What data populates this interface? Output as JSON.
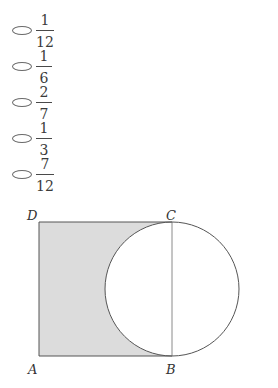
{
  "options": [
    {
      "id": "a",
      "numerator": "1",
      "denominator": "12"
    },
    {
      "id": "b",
      "numerator": "1",
      "denominator": "6"
    },
    {
      "id": "c",
      "numerator": "2",
      "denominator": "7"
    },
    {
      "id": "d",
      "numerator": "1",
      "denominator": "3"
    },
    {
      "id": "e",
      "numerator": "7",
      "denominator": "12"
    }
  ],
  "figure": {
    "labels": {
      "A": "A",
      "B": "B",
      "C": "C",
      "D": "D"
    },
    "shade_color": "#dcdcdc",
    "stroke_color": "#555555"
  }
}
